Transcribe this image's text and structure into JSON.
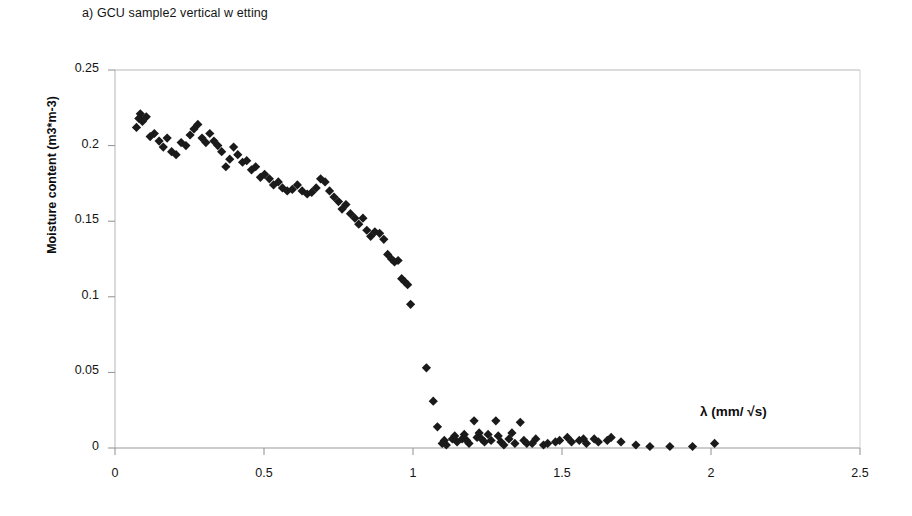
{
  "panel": {
    "title": "a) GCU sample2 vertical w etting"
  },
  "chart_data": {
    "type": "scatter",
    "title": "a) GCU sample2 vertical w etting",
    "xlabel": "λ (mm/ √s)",
    "ylabel": "Moisture content (m3*m-3)",
    "xlim": [
      0,
      2.5
    ],
    "ylim": [
      0,
      0.25
    ],
    "xticks": [
      0,
      0.5,
      1,
      1.5,
      2,
      2.5
    ],
    "xtick_labels": [
      "0",
      "0.5",
      "1",
      "1.5",
      "2",
      "2.5"
    ],
    "yticks": [
      0,
      0.05,
      0.1,
      0.15,
      0.2,
      0.25
    ],
    "ytick_labels": [
      "0",
      "0.05",
      "0.1",
      "0.15",
      "0.2",
      "0.25"
    ],
    "grid": false,
    "legend": false,
    "marker": "diamond",
    "marker_color": "#1a1a1a",
    "marker_size": 8,
    "series": [
      {
        "name": "GCU sample2 vertical wetting",
        "points": [
          [
            0.072,
            0.212
          ],
          [
            0.08,
            0.218
          ],
          [
            0.085,
            0.221
          ],
          [
            0.092,
            0.216
          ],
          [
            0.105,
            0.219
          ],
          [
            0.118,
            0.206
          ],
          [
            0.132,
            0.208
          ],
          [
            0.148,
            0.203
          ],
          [
            0.162,
            0.199
          ],
          [
            0.175,
            0.205
          ],
          [
            0.19,
            0.196
          ],
          [
            0.205,
            0.194
          ],
          [
            0.222,
            0.202
          ],
          [
            0.238,
            0.2
          ],
          [
            0.252,
            0.207
          ],
          [
            0.265,
            0.211
          ],
          [
            0.278,
            0.214
          ],
          [
            0.292,
            0.205
          ],
          [
            0.305,
            0.202
          ],
          [
            0.318,
            0.208
          ],
          [
            0.332,
            0.203
          ],
          [
            0.345,
            0.2
          ],
          [
            0.358,
            0.196
          ],
          [
            0.372,
            0.186
          ],
          [
            0.385,
            0.191
          ],
          [
            0.398,
            0.199
          ],
          [
            0.412,
            0.194
          ],
          [
            0.428,
            0.189
          ],
          [
            0.442,
            0.19
          ],
          [
            0.458,
            0.184
          ],
          [
            0.472,
            0.186
          ],
          [
            0.488,
            0.179
          ],
          [
            0.502,
            0.181
          ],
          [
            0.518,
            0.178
          ],
          [
            0.532,
            0.174
          ],
          [
            0.548,
            0.176
          ],
          [
            0.562,
            0.172
          ],
          [
            0.578,
            0.17
          ],
          [
            0.595,
            0.171
          ],
          [
            0.612,
            0.174
          ],
          [
            0.628,
            0.17
          ],
          [
            0.645,
            0.168
          ],
          [
            0.66,
            0.169
          ],
          [
            0.675,
            0.172
          ],
          [
            0.69,
            0.178
          ],
          [
            0.705,
            0.176
          ],
          [
            0.72,
            0.17
          ],
          [
            0.735,
            0.166
          ],
          [
            0.75,
            0.163
          ],
          [
            0.762,
            0.158
          ],
          [
            0.775,
            0.161
          ],
          [
            0.79,
            0.155
          ],
          [
            0.805,
            0.152
          ],
          [
            0.818,
            0.148
          ],
          [
            0.832,
            0.152
          ],
          [
            0.845,
            0.144
          ],
          [
            0.858,
            0.14
          ],
          [
            0.872,
            0.143
          ],
          [
            0.888,
            0.142
          ],
          [
            0.902,
            0.138
          ],
          [
            0.915,
            0.128
          ],
          [
            0.928,
            0.125
          ],
          [
            0.938,
            0.123
          ],
          [
            0.95,
            0.124
          ],
          [
            0.962,
            0.112
          ],
          [
            0.972,
            0.11
          ],
          [
            0.982,
            0.108
          ],
          [
            0.992,
            0.095
          ],
          [
            1.045,
            0.053
          ],
          [
            1.068,
            0.031
          ],
          [
            1.082,
            0.014
          ],
          [
            1.098,
            0.003
          ],
          [
            1.105,
            0.005
          ],
          [
            1.112,
            0.002
          ],
          [
            1.132,
            0.006
          ],
          [
            1.14,
            0.008
          ],
          [
            1.148,
            0.004
          ],
          [
            1.165,
            0.006
          ],
          [
            1.172,
            0.009
          ],
          [
            1.18,
            0.005
          ],
          [
            1.188,
            0.003
          ],
          [
            1.205,
            0.018
          ],
          [
            1.215,
            0.007
          ],
          [
            1.222,
            0.01
          ],
          [
            1.23,
            0.006
          ],
          [
            1.24,
            0.004
          ],
          [
            1.252,
            0.009
          ],
          [
            1.262,
            0.005
          ],
          [
            1.278,
            0.018
          ],
          [
            1.286,
            0.008
          ],
          [
            1.295,
            0.004
          ],
          [
            1.305,
            0.002
          ],
          [
            1.322,
            0.006
          ],
          [
            1.332,
            0.01
          ],
          [
            1.342,
            0.003
          ],
          [
            1.36,
            0.017
          ],
          [
            1.372,
            0.005
          ],
          [
            1.382,
            0.003
          ],
          [
            1.4,
            0.003
          ],
          [
            1.412,
            0.006
          ],
          [
            1.438,
            0.002
          ],
          [
            1.452,
            0.003
          ],
          [
            1.478,
            0.004
          ],
          [
            1.492,
            0.005
          ],
          [
            1.518,
            0.007
          ],
          [
            1.532,
            0.004
          ],
          [
            1.558,
            0.005
          ],
          [
            1.572,
            0.006
          ],
          [
            1.582,
            0.003
          ],
          [
            1.608,
            0.006
          ],
          [
            1.622,
            0.004
          ],
          [
            1.652,
            0.005
          ],
          [
            1.665,
            0.007
          ],
          [
            1.698,
            0.004
          ],
          [
            1.748,
            0.002
          ],
          [
            1.795,
            0.001
          ],
          [
            1.862,
            0.001
          ],
          [
            1.938,
            0.001
          ],
          [
            2.012,
            0.003
          ]
        ]
      }
    ]
  },
  "axes": {
    "x_tick_labels": [
      "0",
      "0.5",
      "1",
      "1.5",
      "2",
      "2.5"
    ],
    "y_tick_labels": [
      "0",
      "0.05",
      "0.1",
      "0.15",
      "0.2",
      "0.25"
    ],
    "x_title": "λ (mm/ √s)",
    "y_title": "Moisture content (m3*m-3)"
  }
}
